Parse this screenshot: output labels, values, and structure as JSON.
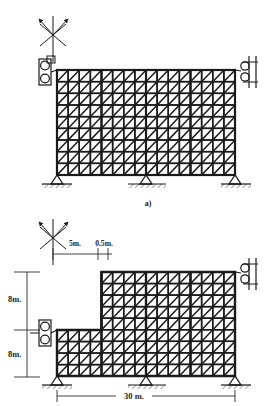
{
  "figure": {
    "title_visible": false,
    "captions": [
      {
        "id": "fig-a",
        "text": "a)",
        "x": 148,
        "y": 203
      }
    ]
  },
  "colors": {
    "line": "#1a1a1a",
    "background": "#ffffff",
    "member": "#1a1a1a",
    "dimension": "#2a2a2a"
  },
  "panel_a": {
    "name": "rectangular-braced-frame",
    "frame": {
      "x": 57,
      "y": 70,
      "width": 178,
      "height": 105
    },
    "grid": {
      "columns": 16,
      "rows": 9
    },
    "bracing": "diagonal-single-per-cell",
    "supports": {
      "base_count": 3,
      "base_type": "pinned-triangle",
      "left_lateral": "roller-bearing-pair",
      "right_lateral": "roller-bearing-pair-wall"
    },
    "anchor_symbol": {
      "type": "crosshair-with-two-arrows",
      "x": 53,
      "y": 35
    }
  },
  "panel_b": {
    "name": "stepped-braced-frame",
    "lower_block": {
      "x": 57,
      "y": 330,
      "width": 46,
      "height": 46
    },
    "upper_block": {
      "x": 103,
      "y": 272,
      "width": 132,
      "height": 104
    },
    "grid": {
      "columns": 16,
      "rows": 9
    },
    "bracing": "diagonal-single-per-cell",
    "supports": {
      "base_count": 3,
      "base_type": "pinned-triangle",
      "left_lateral": "roller-bearing-pair",
      "right_lateral": "roller-bearing-pair-wall"
    },
    "anchor_symbol": {
      "type": "crosshair-with-two-arrows",
      "x": 53,
      "y": 238
    }
  },
  "dimensions": {
    "horizontal_top": [
      {
        "id": "dim-5m",
        "label": "5m.",
        "x": 75,
        "y": 243
      },
      {
        "id": "dim-05m",
        "label": "0.5m.",
        "x": 101,
        "y": 243
      }
    ],
    "vertical_left": [
      {
        "id": "dim-8m-upper",
        "label": "8m.",
        "x": 9,
        "y": 299
      },
      {
        "id": "dim-8m-lower",
        "label": "8m.",
        "x": 9,
        "y": 354
      }
    ],
    "horizontal_bottom": [
      {
        "id": "dim-30m",
        "label": "30 m.",
        "x": 133,
        "y": 396
      }
    ]
  },
  "icons": {
    "anchor": "crosshair-anchor-icon",
    "roller": "roller-support-icon",
    "pin": "pin-support-icon",
    "arrow": "arrow-icon"
  }
}
